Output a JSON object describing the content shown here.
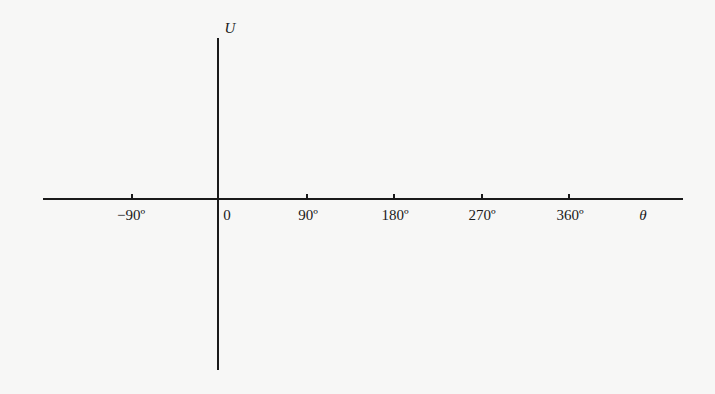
{
  "diagram": {
    "y_axis_label": "U",
    "x_axis_label": "θ",
    "origin_label": "0",
    "ticks": [
      {
        "label": "−90º",
        "x": 131
      },
      {
        "label": "90º",
        "x": 306
      },
      {
        "label": "180º",
        "x": 393
      },
      {
        "label": "270º",
        "x": 481
      },
      {
        "label": "360º",
        "x": 568
      }
    ]
  }
}
